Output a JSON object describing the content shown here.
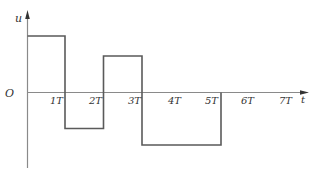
{
  "diagram": {
    "type": "square-waveform",
    "axes": {
      "y_label": "u",
      "x_label": "t",
      "origin_label": "O"
    },
    "tick_labels": [
      "1T",
      "2T",
      "3T",
      "4T",
      "5T",
      "6T",
      "7T"
    ],
    "colors": {
      "line": "#555555",
      "axis": "#777777",
      "text": "#333333",
      "background": "#ffffff"
    },
    "segments": [
      {
        "from_T": 0,
        "to_T": 1,
        "level": "high (+)"
      },
      {
        "from_T": 1,
        "to_T": 2,
        "level": "low (-)"
      },
      {
        "from_T": 2,
        "to_T": 3,
        "level": "medium high (+)"
      },
      {
        "from_T": 3,
        "to_T": 5,
        "level": "lower (-)"
      },
      {
        "from_T": 5,
        "to_T": 7,
        "level": "zero"
      }
    ]
  }
}
